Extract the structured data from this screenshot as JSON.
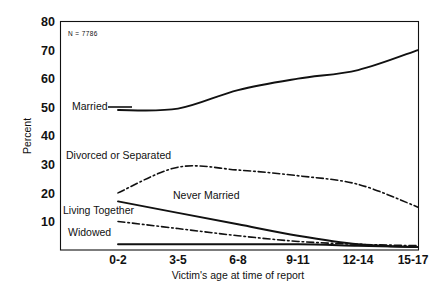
{
  "chart_data": {
    "type": "line",
    "title": "",
    "xlabel": "Victim's age at time of report",
    "ylabel": "Percent",
    "annotation": "N = 7786",
    "categories": [
      "0-2",
      "3-5",
      "6-8",
      "9-11",
      "12-14",
      "15-17"
    ],
    "ylim": [
      0,
      80
    ],
    "yticks": [
      10,
      20,
      30,
      40,
      50,
      60,
      70,
      80
    ],
    "grid": false,
    "legend_position": "inline-labels",
    "series": [
      {
        "name": "Married",
        "style": "solid",
        "values": [
          49,
          49.5,
          56,
          60,
          63,
          70
        ]
      },
      {
        "name": "Divorced or Separated",
        "style": "dash-dot",
        "values": [
          20,
          29,
          28,
          26,
          23,
          15
        ]
      },
      {
        "name": "Never Married",
        "style": "solid",
        "values": [
          17,
          13,
          9,
          5,
          2,
          1
        ]
      },
      {
        "name": "Living Together",
        "style": "dash-dot",
        "values": [
          10,
          7.5,
          5,
          3,
          2,
          1.5
        ]
      },
      {
        "name": "Widowed",
        "style": "solid",
        "values": [
          2,
          2,
          2,
          2,
          1.5,
          1
        ]
      }
    ]
  },
  "labels": {
    "y_ticks": [
      "80",
      "70",
      "60",
      "50",
      "40",
      "30",
      "20",
      "10"
    ],
    "x_ticks": [
      "0-2",
      "3-5",
      "6-8",
      "9-11",
      "12-14",
      "15-17"
    ],
    "y_axis_title": "Percent",
    "x_axis_title": "Victim's age at time of report",
    "sample_note": "N = 7786",
    "series_married": "Married",
    "series_divorced": "Divorced or Separated",
    "series_never_married": "Never Married",
    "series_living_together": "Living Together",
    "series_widowed": "Widowed"
  },
  "colors": {
    "ink": "#111111",
    "background": "#ffffff"
  }
}
